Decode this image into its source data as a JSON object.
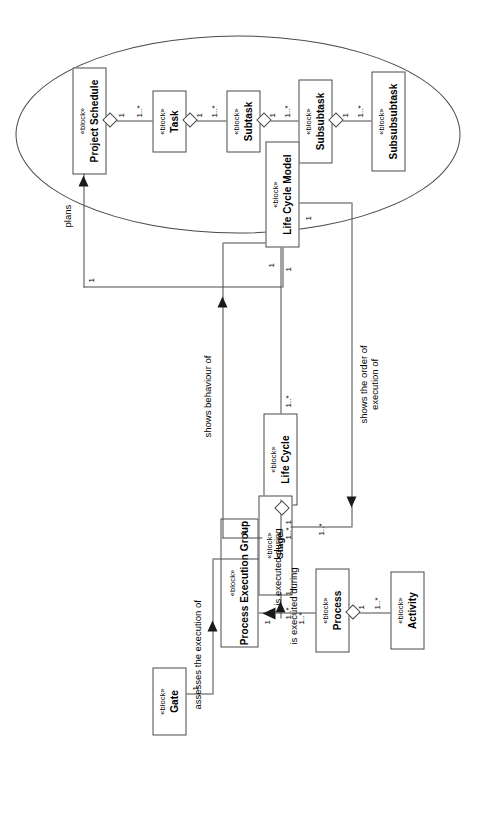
{
  "diagram": {
    "type": "sysml-block-definition-diagram",
    "orientation": "rotated-90-ccw",
    "stereotype": "«block»",
    "line_color": "#4a4a4a",
    "fill_color": "#ffffff",
    "text_color": "#000000"
  },
  "blocks": [
    {
      "id": "project-schedule",
      "stereotype": "«block»",
      "name": "Project Schedule"
    },
    {
      "id": "task",
      "stereotype": "«block»",
      "name": "Task"
    },
    {
      "id": "subtask",
      "stereotype": "«block»",
      "name": "Subtask"
    },
    {
      "id": "subsubtask",
      "stereotype": "«block»",
      "name": "Subsubtask"
    },
    {
      "id": "subsubsubtask",
      "stereotype": "«block»",
      "name": "Subsubsubtask"
    },
    {
      "id": "life-cycle-model",
      "stereotype": "«block»",
      "name": "Life Cycle Model"
    },
    {
      "id": "life-cycle",
      "stereotype": "«block»",
      "name": "Life Cycle"
    },
    {
      "id": "stage",
      "stereotype": "«block»",
      "name": "Stage"
    },
    {
      "id": "process-execution-group",
      "stereotype": "«block»",
      "name": "Process Execution Group"
    },
    {
      "id": "process",
      "stereotype": "«block»",
      "name": "Process"
    },
    {
      "id": "activity",
      "stereotype": "«block»",
      "name": "Activity"
    },
    {
      "id": "gate",
      "stereotype": "«block»",
      "name": "Gate"
    }
  ],
  "multiplicities": {
    "one": "1",
    "one_to_many": "1..*"
  },
  "associations": [
    {
      "id": "ps-task",
      "from": "project-schedule",
      "to": "task",
      "kind": "composition",
      "from_mult": "1",
      "to_mult": "1..*"
    },
    {
      "id": "task-subtask",
      "from": "task",
      "to": "subtask",
      "kind": "composition",
      "from_mult": "1",
      "to_mult": "1..*"
    },
    {
      "id": "sub-subsub",
      "from": "subtask",
      "to": "subsubtask",
      "kind": "composition",
      "from_mult": "1",
      "to_mult": "1..*"
    },
    {
      "id": "subsub-subsubsub",
      "from": "subsubtask",
      "to": "subsubsubtask",
      "kind": "composition",
      "from_mult": "1",
      "to_mult": "1..*"
    },
    {
      "id": "lcm-lc",
      "from": "life-cycle-model",
      "to": "life-cycle",
      "kind": "composition",
      "from_mult": "1..*",
      "to_mult": "1"
    },
    {
      "id": "lc-stage",
      "from": "life-cycle",
      "to": "stage",
      "kind": "composition",
      "from_mult": "1",
      "to_mult": "1..*"
    },
    {
      "id": "proc-activity",
      "from": "process",
      "to": "activity",
      "kind": "composition",
      "from_mult": "1",
      "to_mult": "1..*"
    },
    {
      "id": "peg-stage",
      "from": "process-execution-group",
      "to": "stage",
      "kind": "directed",
      "label": "is executed during",
      "from_mult": "1..*",
      "to_mult": "1"
    },
    {
      "id": "proc-peg",
      "from": "process",
      "to": "process-execution-group",
      "kind": "directed",
      "label": "is executed during",
      "from_mult": "1..*",
      "to_mult": "1"
    },
    {
      "id": "lcm-plans",
      "from": "life-cycle-model",
      "to": "project-schedule",
      "kind": "directed",
      "label": "plans",
      "from_mult": "1",
      "to_mult": "1"
    },
    {
      "id": "stage-behaviour",
      "from": "stage",
      "to": "life-cycle-model",
      "kind": "directed",
      "label": "shows behaviour of",
      "from_mult": "1..*",
      "to_mult": "1"
    },
    {
      "id": "lcm-order",
      "from": "life-cycle-model",
      "to": "process-execution-group",
      "kind": "directed",
      "label": "shows the order of execution of",
      "from_mult": "1",
      "to_mult": "1..*"
    },
    {
      "id": "gate-assesses",
      "from": "gate",
      "to": "stage",
      "kind": "directed",
      "label": "assesses the execution of",
      "from_mult": "1",
      "to_mult": "1"
    }
  ],
  "labels": {
    "plans": "plans",
    "shows_behaviour_of": "shows behaviour of",
    "shows_order_line1": "shows the order of",
    "shows_order_line2": "execution of",
    "is_executed_during_1": "is executed during",
    "is_executed_during_2": "is executed during",
    "assesses_the_execution_of": "assesses the execution of"
  },
  "grouping": {
    "shape": "ellipse",
    "encloses": [
      "project-schedule",
      "task",
      "subtask",
      "subsubtask",
      "subsubsubtask"
    ]
  }
}
